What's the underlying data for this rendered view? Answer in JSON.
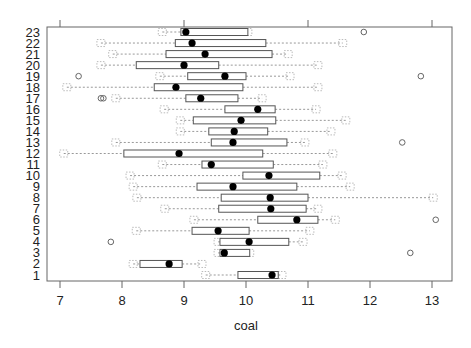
{
  "chart_data": {
    "type": "boxplot",
    "orientation": "horizontal",
    "title": "",
    "xlabel": "coal",
    "ylabel": "",
    "xlim": [
      6.8,
      13.3
    ],
    "xticks": [
      7,
      8,
      9,
      10,
      11,
      12,
      13
    ],
    "xtick_labels": [
      "7",
      "8",
      "9",
      "10",
      "11",
      "12",
      "13"
    ],
    "grid": false,
    "legend": null,
    "categories": [
      "1",
      "2",
      "3",
      "4",
      "5",
      "6",
      "7",
      "8",
      "9",
      "10",
      "11",
      "12",
      "13",
      "14",
      "15",
      "16",
      "17",
      "18",
      "19",
      "20",
      "21",
      "22",
      "23"
    ],
    "series": [
      {
        "name": "1",
        "whisker_low": 9.35,
        "q1": 9.87,
        "median": 10.42,
        "q3": 10.52,
        "whisker_high": 10.58,
        "outliers": []
      },
      {
        "name": "2",
        "whisker_low": 8.18,
        "q1": 8.29,
        "median": 8.76,
        "q3": 8.97,
        "whisker_high": 9.29,
        "outliers": []
      },
      {
        "name": "3",
        "whisker_low": 9.55,
        "q1": 9.58,
        "median": 9.65,
        "q3": 10.06,
        "whisker_high": 10.06,
        "outliers": [
          12.65
        ]
      },
      {
        "name": "4",
        "whisker_low": 9.55,
        "q1": 9.58,
        "median": 10.05,
        "q3": 10.69,
        "whisker_high": 10.92,
        "outliers": [
          7.82
        ]
      },
      {
        "name": "5",
        "whisker_low": 8.23,
        "q1": 9.13,
        "median": 9.55,
        "q3": 10.05,
        "whisker_high": 11.03,
        "outliers": []
      },
      {
        "name": "6",
        "whisker_low": 9.16,
        "q1": 10.19,
        "median": 10.82,
        "q3": 11.16,
        "whisker_high": 11.44,
        "outliers": [
          13.06
        ]
      },
      {
        "name": "7",
        "whisker_low": 8.69,
        "q1": 9.56,
        "median": 10.4,
        "q3": 10.97,
        "whisker_high": 11.16,
        "outliers": []
      },
      {
        "name": "8",
        "whisker_low": 8.24,
        "q1": 9.6,
        "median": 10.39,
        "q3": 11.0,
        "whisker_high": 13.02,
        "outliers": []
      },
      {
        "name": "9",
        "whisker_low": 8.18,
        "q1": 9.21,
        "median": 9.79,
        "q3": 10.82,
        "whisker_high": 11.68,
        "outliers": []
      },
      {
        "name": "10",
        "whisker_low": 8.13,
        "q1": 9.95,
        "median": 10.37,
        "q3": 11.19,
        "whisker_high": 11.55,
        "outliers": []
      },
      {
        "name": "11",
        "whisker_low": 8.65,
        "q1": 9.29,
        "median": 9.44,
        "q3": 10.44,
        "whisker_high": 11.24,
        "outliers": []
      },
      {
        "name": "12",
        "whisker_low": 7.06,
        "q1": 8.03,
        "median": 8.92,
        "q3": 10.27,
        "whisker_high": 11.4,
        "outliers": []
      },
      {
        "name": "13",
        "whisker_low": 7.9,
        "q1": 9.44,
        "median": 9.79,
        "q3": 10.66,
        "whisker_high": 10.95,
        "outliers": [
          12.52
        ]
      },
      {
        "name": "14",
        "whisker_low": 8.94,
        "q1": 9.4,
        "median": 9.81,
        "q3": 10.35,
        "whisker_high": 11.37,
        "outliers": []
      },
      {
        "name": "15",
        "whisker_low": 8.94,
        "q1": 9.15,
        "median": 9.92,
        "q3": 10.48,
        "whisker_high": 11.61,
        "outliers": []
      },
      {
        "name": "16",
        "whisker_low": 8.68,
        "q1": 9.66,
        "median": 10.19,
        "q3": 10.47,
        "whisker_high": 11.13,
        "outliers": []
      },
      {
        "name": "17",
        "whisker_low": 7.9,
        "q1": 9.03,
        "median": 9.27,
        "q3": 9.87,
        "whisker_high": 10.26,
        "outliers": [
          7.66,
          7.7
        ]
      },
      {
        "name": "18",
        "whisker_low": 7.11,
        "q1": 8.52,
        "median": 8.87,
        "q3": 9.95,
        "whisker_high": 11.16,
        "outliers": []
      },
      {
        "name": "19",
        "whisker_low": 8.61,
        "q1": 9.06,
        "median": 9.66,
        "q3": 10.0,
        "whisker_high": 10.71,
        "outliers": [
          7.3,
          12.82
        ]
      },
      {
        "name": "20",
        "whisker_low": 7.66,
        "q1": 8.23,
        "median": 9.0,
        "q3": 9.56,
        "whisker_high": 11.16,
        "outliers": []
      },
      {
        "name": "21",
        "whisker_low": 7.85,
        "q1": 8.71,
        "median": 9.34,
        "q3": 10.42,
        "whisker_high": 10.68,
        "outliers": []
      },
      {
        "name": "22",
        "whisker_low": 7.66,
        "q1": 8.86,
        "median": 9.13,
        "q3": 10.32,
        "whisker_high": 11.56,
        "outliers": []
      },
      {
        "name": "23",
        "whisker_low": 8.65,
        "q1": 8.95,
        "median": 9.03,
        "q3": 10.03,
        "whisker_high": 10.03,
        "outliers": [
          11.9
        ]
      }
    ]
  },
  "colors": {
    "frame": "#666666",
    "box_stroke": "#555555",
    "box_fill": "#ffffff",
    "whisker": "#999999",
    "median_dot": "#000000",
    "outlier": "#666666",
    "text": "#222222"
  }
}
